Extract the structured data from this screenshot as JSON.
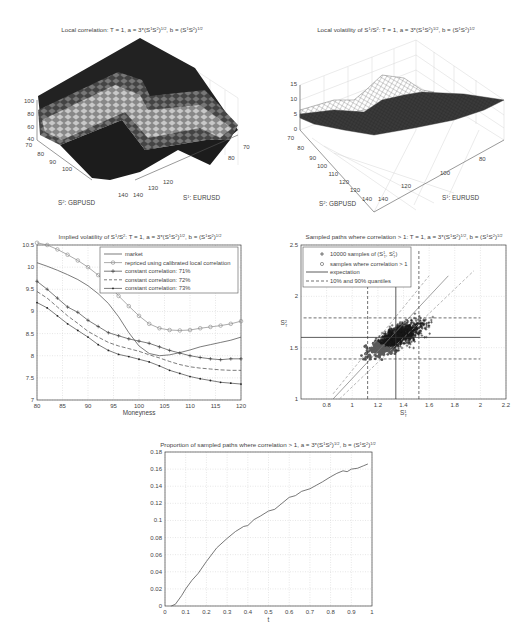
{
  "chart_data": [
    {
      "type": "surface",
      "title": "Local correlation: T = 1, a = 3*(S¹S²)^(1/2), b = (S¹S²)^(1/2)",
      "title_main": "Local correlation: T = 1, a = 3*(S",
      "xlabel": "S¹: EURUSD",
      "ylabel": "S²: GBPUSD",
      "zlabel": "",
      "x_ticks": [
        "70",
        "80",
        "90",
        "100",
        "110",
        "120",
        "130",
        "140"
      ],
      "x_ticks_visible": [
        "70",
        "80",
        "120",
        "130",
        "140"
      ],
      "y_ticks": [
        "70",
        "80",
        "90",
        "100",
        "140"
      ],
      "z_ticks": [
        "40",
        "60",
        "80",
        "100"
      ],
      "zlim": [
        40,
        100
      ],
      "colormap": "gray",
      "description": "Shaded surface: plateau at 100 near low S1/low S2 and high S1/high S2 ridge, diagonal valley band of lighter values around 60-80"
    },
    {
      "type": "mesh",
      "title": "Local volatility of S¹/S²: T = 1, a = 3*(S¹S²)^(1/2), b = (S¹S²)^(1/2)",
      "xlabel": "S¹: EURUSD",
      "ylabel": "S²: GBPUSD",
      "x_ticks": [
        "80",
        "100",
        "120",
        "140"
      ],
      "y_ticks": [
        "70",
        "80",
        "90",
        "100",
        "110",
        "120",
        "130",
        "140"
      ],
      "z_ticks": [
        "0",
        "5",
        "10",
        "15"
      ],
      "zlim": [
        0,
        15
      ],
      "description": "Wireframe surface mostly between 4 and 10 with a bump to ~11 in middle region"
    },
    {
      "type": "line",
      "title": "Implied volatility of S¹/S²: T = 1, a = 3*(S¹S²)^(1/2), b = (S¹S²)^(1/2)",
      "xlabel": "Moneyness",
      "ylabel": "",
      "xlim": [
        80,
        120
      ],
      "ylim": [
        7,
        10.5
      ],
      "x_ticks": [
        "80",
        "85",
        "90",
        "95",
        "100",
        "105",
        "110",
        "115",
        "120"
      ],
      "y_ticks": [
        "7",
        "7.5",
        "8",
        "8.5",
        "9",
        "9.5",
        "10",
        "10.5"
      ],
      "grid": true,
      "legend_position": "upper right",
      "x": [
        80,
        82,
        84,
        86,
        88,
        90,
        92,
        94,
        96,
        98,
        100,
        102,
        104,
        106,
        108,
        110,
        112,
        114,
        116,
        118,
        120
      ],
      "series": [
        {
          "name": "market",
          "marker": "none",
          "dash": "solid",
          "values": [
            10.1,
            10.02,
            9.93,
            9.83,
            9.72,
            9.58,
            9.4,
            9.18,
            8.88,
            8.52,
            8.22,
            8.05,
            8.0,
            8.02,
            8.07,
            8.13,
            8.2,
            8.25,
            8.3,
            8.35,
            8.42
          ]
        },
        {
          "name": "repriced using calibrated local correlation",
          "marker": "circle",
          "dash": "solid",
          "values": [
            10.55,
            10.5,
            10.4,
            10.28,
            10.15,
            10.0,
            9.82,
            9.6,
            9.35,
            9.12,
            8.9,
            8.72,
            8.62,
            8.58,
            8.57,
            8.58,
            8.62,
            8.65,
            8.68,
            8.72,
            8.78
          ]
        },
        {
          "name": "constant correlation: 71%",
          "marker": "plus",
          "dash": "solid",
          "values": [
            9.68,
            9.5,
            9.3,
            9.1,
            8.98,
            8.8,
            8.66,
            8.52,
            8.45,
            8.38,
            8.33,
            8.28,
            8.2,
            8.12,
            8.06,
            8.0,
            7.96,
            7.93,
            7.91,
            7.93,
            7.93
          ]
        },
        {
          "name": "constant correlation: 72%",
          "marker": "none",
          "dash": "dashed",
          "values": [
            9.45,
            9.3,
            9.1,
            8.9,
            8.73,
            8.55,
            8.42,
            8.3,
            8.22,
            8.16,
            8.1,
            8.02,
            7.95,
            7.87,
            7.8,
            7.75,
            7.72,
            7.7,
            7.68,
            7.67,
            7.67
          ]
        },
        {
          "name": "constant correlation: 73%",
          "marker": "dot",
          "dash": "solid",
          "values": [
            9.2,
            9.08,
            8.9,
            8.72,
            8.57,
            8.42,
            8.25,
            8.12,
            8.03,
            7.98,
            7.92,
            7.86,
            7.77,
            7.67,
            7.6,
            7.53,
            7.48,
            7.44,
            7.4,
            7.38,
            7.36
          ]
        }
      ]
    },
    {
      "type": "scatter",
      "title": "Sampled paths where correlation > 1: T = 1, a = 3*(S¹S²)^(1/2), b = (S¹S²)^(1/2)",
      "xlabel": "S¹_T",
      "ylabel": "S²_T",
      "xlim": [
        0.6,
        2.2
      ],
      "ylim": [
        1,
        2.5
      ],
      "x_ticks": [
        "0.8",
        "1",
        "1.2",
        "1.4",
        "1.6",
        "1.8",
        "2",
        "2.2"
      ],
      "y_ticks": [
        "1",
        "1.5",
        "2",
        "2.5"
      ],
      "grid": true,
      "legend_position": "upper left",
      "legend": [
        "10000 samples of (S¹_T, S²_T)",
        "samples where correlation > 1",
        "expectation",
        "10% and 90% quantiles"
      ],
      "expectation": {
        "x": 1.34,
        "y": 1.6
      },
      "quantiles": {
        "x10": 1.12,
        "x90": 1.52,
        "y10": 1.39,
        "y90": 1.79
      },
      "description": "Dense cloud of 10000 '+' samples centered near (1.35, 1.6); lower-left region filled with circle markers where correlation > 1"
    },
    {
      "type": "line",
      "title": "Proportion of sampled paths where correlation > 1, a = 3*(S¹S²)^(1/2), b = (S¹S²)^(1/2)",
      "xlabel": "t",
      "ylabel": "",
      "xlim": [
        0,
        1
      ],
      "ylim": [
        0,
        0.18
      ],
      "x_ticks": [
        "0",
        "0.1",
        "0.2",
        "0.3",
        "0.4",
        "0.5",
        "0.6",
        "0.7",
        "0.8",
        "0.9",
        "1"
      ],
      "y_ticks": [
        "0",
        "0.02",
        "0.04",
        "0.06",
        "0.08",
        "0.1",
        "0.12",
        "0.14",
        "0.16",
        "0.18"
      ],
      "grid": true,
      "x": [
        0.03,
        0.05,
        0.08,
        0.1,
        0.13,
        0.16,
        0.2,
        0.25,
        0.3,
        0.34,
        0.38,
        0.4,
        0.43,
        0.46,
        0.5,
        0.53,
        0.56,
        0.6,
        0.63,
        0.66,
        0.7,
        0.73,
        0.76,
        0.8,
        0.83,
        0.86,
        0.88,
        0.9,
        0.93,
        0.96,
        0.98
      ],
      "values": [
        0.0,
        0.002,
        0.012,
        0.02,
        0.03,
        0.038,
        0.052,
        0.068,
        0.079,
        0.087,
        0.093,
        0.094,
        0.101,
        0.105,
        0.111,
        0.113,
        0.119,
        0.127,
        0.129,
        0.134,
        0.137,
        0.141,
        0.145,
        0.151,
        0.155,
        0.158,
        0.157,
        0.16,
        0.161,
        0.164,
        0.166
      ]
    }
  ],
  "panels": {
    "corr3d": {
      "title_pre": "Local correlation: T = 1, a = 3*(S",
      "xlabel_pre": "S",
      "xlabel_sup": "1",
      "xlabel_post": ": EURUSD",
      "ylabel_pre": "S",
      "ylabel_sup": "2",
      "ylabel_post": ": GBPUSD",
      "z_ticks": [
        "100",
        "80",
        "60",
        "40"
      ],
      "y_ticks": [
        "70",
        "80",
        "90",
        "100",
        "140"
      ],
      "x_ticks": [
        "140",
        "130",
        "120",
        "80",
        "70"
      ]
    },
    "vol3d": {
      "title_pre": "Local volatility of S",
      "xlabel_pre": "S",
      "xlabel_sup": "1",
      "xlabel_post": ": EURUSD",
      "ylabel_pre": "S",
      "ylabel_sup": "2",
      "ylabel_post": ": GBPUSD",
      "z_ticks": [
        "15",
        "10",
        "5",
        "0"
      ],
      "y_ticks": [
        "70",
        "80",
        "90",
        "100",
        "110",
        "120",
        "130",
        "140"
      ],
      "x_ticks": [
        "140",
        "120",
        "100",
        "80"
      ]
    },
    "implied": {
      "title_pre": "Implied volatility of S",
      "xlabel": "Moneyness",
      "legend": [
        "market",
        "repriced using calibrated local correlation",
        "constant correlation: 71%",
        "constant correlation: 72%",
        "constant correlation: 73%"
      ]
    },
    "scatter": {
      "title_pre": "Sampled paths where correlation > 1: T = 1, a = 3*(S",
      "legend": [
        "10000 samples of (S",
        "samples where correlation > 1",
        "expectation",
        "10% and 90% quantiles"
      ]
    },
    "proportion": {
      "title_pre": "Proportion of sampled paths where correlation > 1, a = 3*(S",
      "xlabel": "t"
    }
  },
  "colors": {
    "line": "#555555",
    "grid": "#cfcfcf",
    "axis": "#444444",
    "cloud_dark": "#1a1a1a",
    "cloud_gray": "#5a5a5a"
  }
}
